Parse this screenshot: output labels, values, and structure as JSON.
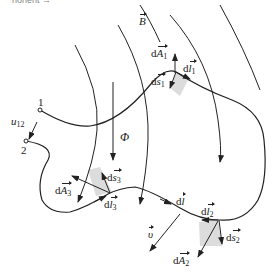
{
  "header_fragment": "nonent →",
  "labels": {
    "B": "B",
    "A1": "A",
    "A1_sub": "1",
    "l1": "l",
    "l1_sub": "1",
    "s1": "s",
    "s1_sub": "1",
    "u12": "u",
    "u12_sub": "12",
    "point1": "1",
    "point2": "2",
    "phi": "Φ",
    "A3": "A",
    "A3_sub": "3",
    "s3": "s",
    "s3_sub": "3",
    "l3": "l",
    "l3_sub": "3",
    "l": "l",
    "l2": "l",
    "l2_sub": "2",
    "v": "υ",
    "s2": "s",
    "s2_sub": "2",
    "A2": "A",
    "A2_sub": "2",
    "d": "d"
  },
  "colors": {
    "line": "#222222",
    "patch": "#dcdcdc"
  }
}
